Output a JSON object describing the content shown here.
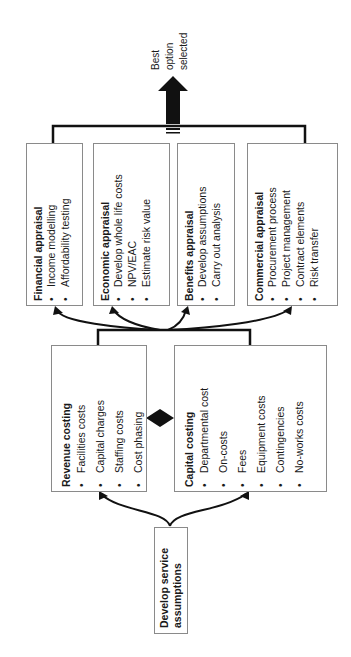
{
  "output": {
    "label_lines": [
      "Best",
      "option",
      "selected"
    ]
  },
  "appraisals": [
    {
      "title": "Financial appraisal",
      "items": [
        "Income modelling",
        "Affordability testing"
      ]
    },
    {
      "title": "Economic appraisal",
      "items": [
        "Develop whole life costs",
        "NPV/EAC",
        "Estimate risk value"
      ]
    },
    {
      "title": "Benefits appraisal",
      "items": [
        "Develop assumptions",
        "Carry out analysis"
      ]
    },
    {
      "title": "Commercial appraisal",
      "items": [
        "Procurement process",
        "Project management",
        "Contract elements",
        "Risk transfer"
      ]
    }
  ],
  "costings": [
    {
      "title": "Revenue costing",
      "items": [
        "Facilities costs",
        "Capital charges",
        "Staffing costs",
        "Cost phasing"
      ]
    },
    {
      "title": "Capital costing",
      "items": [
        "Departmental cost",
        "On-costs",
        "Fees",
        "Equipment costs",
        "Contingencies",
        "No-works costs"
      ]
    }
  ],
  "start": {
    "label_lines": [
      "Develop service",
      "assumptions"
    ]
  },
  "colors": {
    "line": "#111111",
    "border": "#8a8a8a",
    "text": "#1a1a1a"
  }
}
